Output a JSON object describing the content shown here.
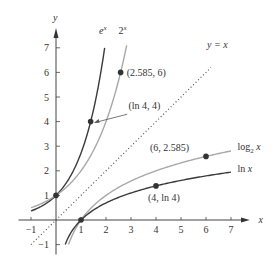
{
  "chart_data": {
    "type": "line",
    "title": "",
    "xlabel": "x",
    "ylabel": "y",
    "xlim": [
      -1,
      7
    ],
    "ylim": [
      -1,
      7
    ],
    "grid": false,
    "x_ticks": [
      "-1",
      "1",
      "2",
      "3",
      "4",
      "5",
      "6",
      "7"
    ],
    "y_ticks": [
      "-1",
      "1",
      "2",
      "3",
      "4",
      "5",
      "6",
      "7"
    ],
    "series": [
      {
        "name": "e^x",
        "label": "e",
        "sup": "x",
        "function": "exp(x)",
        "color": "#3a3a3a",
        "style": "solid"
      },
      {
        "name": "2^x",
        "label": "2",
        "sup": "x",
        "function": "2^x",
        "color": "#a8a8a8",
        "style": "solid"
      },
      {
        "name": "y = x",
        "label": "y = x",
        "function": "x",
        "color": "#555555",
        "style": "dotted"
      },
      {
        "name": "log2 x",
        "label": "log",
        "sub": "2",
        "suffix": " x",
        "function": "log2(x)",
        "color": "#a8a8a8",
        "style": "solid"
      },
      {
        "name": "ln x",
        "label": "ln ",
        "suffix": "x",
        "function": "ln(x)",
        "color": "#3a3a3a",
        "style": "solid"
      }
    ],
    "annotations": [
      {
        "text": "(2.585, 6)",
        "x": 2.585,
        "y": 6
      },
      {
        "text": "(ln 4, 4)",
        "x": 1.386,
        "y": 4,
        "arrow": true
      },
      {
        "text": "(6, 2.585)",
        "x": 6,
        "y": 2.585
      },
      {
        "text": "(4, ln 4)",
        "x": 4,
        "y": 1.386
      }
    ],
    "points": [
      {
        "x": 0,
        "y": 1
      },
      {
        "x": 1,
        "y": 0
      },
      {
        "x": 1.386,
        "y": 4
      },
      {
        "x": 2.585,
        "y": 6
      },
      {
        "x": 6,
        "y": 2.585
      },
      {
        "x": 4,
        "y": 1.386
      }
    ]
  }
}
